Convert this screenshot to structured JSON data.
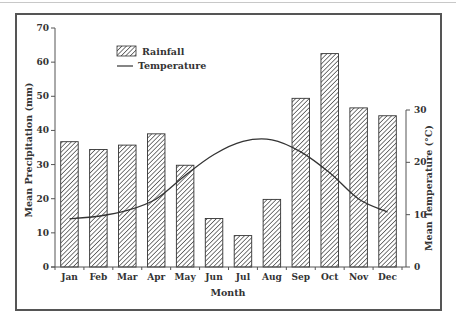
{
  "chart_data": {
    "type": "bar",
    "title": "",
    "xlabel": "Month",
    "ylabel": "Mean Precipitation (mm)",
    "y2label": "Mean Temperature (°C)",
    "categories": [
      "Jan",
      "Feb",
      "Mar",
      "Apr",
      "May",
      "Jun",
      "Jul",
      "Aug",
      "Sep",
      "Oct",
      "Nov",
      "Dec"
    ],
    "series": [
      {
        "name": "Rainfall",
        "type": "bar",
        "axis": "left",
        "pattern": "diagonal-hatch",
        "values": [
          36.7,
          34.4,
          35.7,
          39.0,
          29.8,
          14.2,
          9.2,
          19.8,
          49.4,
          62.5,
          46.6,
          44.3
        ]
      },
      {
        "name": "Temperature",
        "type": "line",
        "axis": "right",
        "values": [
          9.2,
          9.7,
          10.8,
          13.0,
          17.5,
          21.5,
          24.0,
          24.3,
          22.0,
          18.0,
          13.0,
          10.5
        ]
      }
    ],
    "ylim": [
      0,
      70
    ],
    "yticks": [
      0,
      10,
      20,
      30,
      40,
      50,
      60,
      70
    ],
    "y2lim": [
      0,
      30
    ],
    "y2ticks": [
      0,
      10,
      20,
      30
    ],
    "grid": false,
    "legend_position": "upper-left"
  },
  "legend": {
    "rainfall": "Rainfall",
    "temperature": "Temperature"
  },
  "axes": {
    "x_title": "Month",
    "y_title": "Mean Precipitation (mm)",
    "y2_title": "Mean Temperature (°C)"
  },
  "colors": {
    "bar_stroke": "#333333",
    "line": "#333333",
    "axis": "#555555",
    "frame": "#555555"
  }
}
